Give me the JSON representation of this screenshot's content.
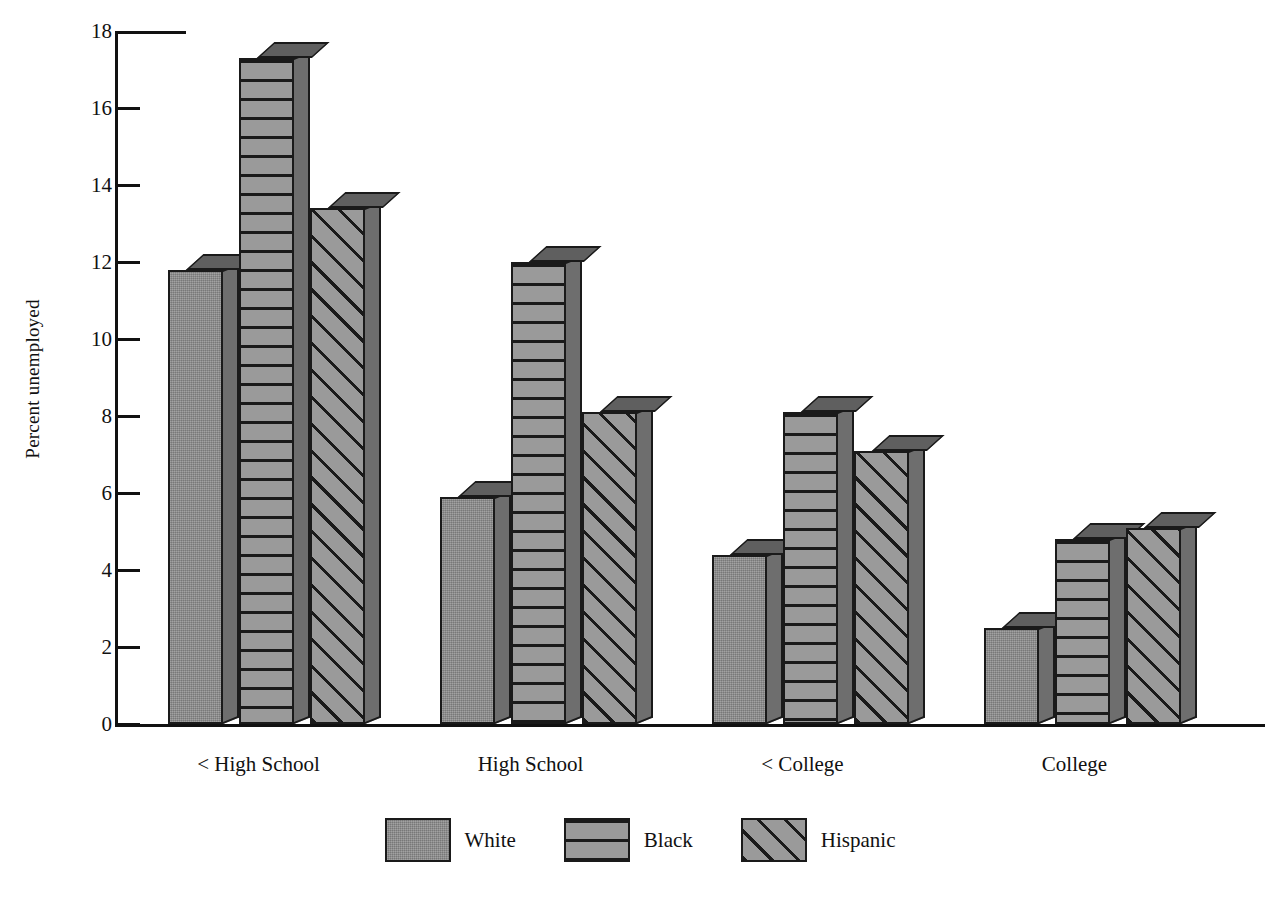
{
  "chart_data": {
    "type": "bar",
    "title": "",
    "xlabel": "",
    "ylabel": "Percent unemployed",
    "ylim": [
      0,
      18
    ],
    "yticks": [
      0,
      2,
      4,
      6,
      8,
      10,
      12,
      14,
      16,
      18
    ],
    "ytick_labels": [
      "0",
      "2",
      "4",
      "6",
      "8",
      "10",
      "12",
      "14",
      "16",
      "18"
    ],
    "grid": false,
    "legend_position": "bottom",
    "categories": [
      "< High School",
      "High School",
      "< College",
      "College"
    ],
    "series": [
      {
        "name": "White",
        "pattern": "solid",
        "values": [
          11.8,
          5.9,
          4.4,
          2.5
        ]
      },
      {
        "name": "Black",
        "pattern": "horizontal",
        "values": [
          17.3,
          12.0,
          8.1,
          4.8
        ]
      },
      {
        "name": "Hispanic",
        "pattern": "diagonal",
        "values": [
          13.4,
          8.1,
          7.1,
          5.1
        ]
      }
    ]
  },
  "colors": {
    "bar_face": "#8b8b8b",
    "bar_side": "#6e6e6e",
    "bar_top": "#5f5f5f",
    "outline": "#1a1a1a",
    "background": "#ffffff"
  },
  "legend": {
    "items": [
      {
        "label": "White"
      },
      {
        "label": "Black"
      },
      {
        "label": "Hispanic"
      }
    ]
  }
}
